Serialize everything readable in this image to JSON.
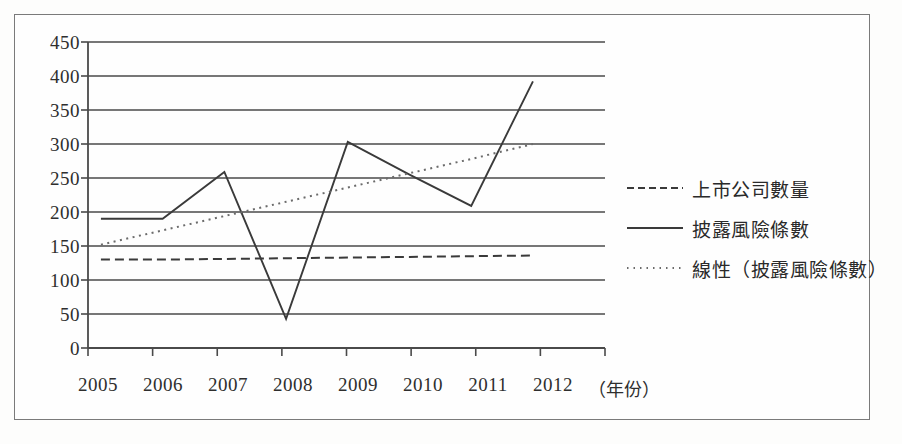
{
  "chart_data": {
    "type": "line",
    "title": "",
    "xlabel": "（年份）",
    "ylabel": "",
    "categories": [
      "2005",
      "2006",
      "2007",
      "2008",
      "2009",
      "2010",
      "2011",
      "2012"
    ],
    "x_tick_labels": [
      "2005",
      "2006",
      "2007",
      "2008",
      "2009",
      "2010",
      "2011",
      "2012"
    ],
    "y_tick_labels": [
      "0",
      "50",
      "100",
      "150",
      "200",
      "250",
      "300",
      "350",
      "400",
      "450"
    ],
    "y_ticks": [
      0,
      50,
      100,
      150,
      200,
      250,
      300,
      350,
      400,
      450
    ],
    "ylim": [
      0,
      450
    ],
    "grid": "horizontal",
    "legend_position": "right",
    "series": [
      {
        "name": "上市公司數量",
        "style": "dashed",
        "color": "#3a3a3a",
        "values": [
          130,
          130,
          131,
          132,
          133,
          134,
          135,
          136
        ]
      },
      {
        "name": "披露風險條數",
        "style": "solid",
        "color": "#3a3a3a",
        "values": [
          190,
          190,
          259,
          43,
          303,
          255,
          209,
          392
        ]
      },
      {
        "name": "線性（披露風險條數）",
        "style": "dotted",
        "color": "#6b6b6b",
        "values": [
          152,
          173,
          194,
          215,
          236,
          257,
          278,
          300
        ]
      }
    ]
  },
  "legend": {
    "items": [
      {
        "label": "上市公司數量",
        "style": "dashed"
      },
      {
        "label": "披露風險條數",
        "style": "solid"
      },
      {
        "label": "線性（披露風險條數）",
        "style": "dotted"
      }
    ]
  },
  "axes": {
    "x_title": "（年份）",
    "y_tick_0": "0",
    "y_tick_1": "50",
    "y_tick_2": "100",
    "y_tick_3": "150",
    "y_tick_4": "200",
    "y_tick_5": "250",
    "y_tick_6": "300",
    "y_tick_7": "350",
    "y_tick_8": "400",
    "y_tick_9": "450"
  },
  "colors": {
    "line": "#3a3a3a",
    "trend": "#6b6b6b",
    "grid": "#4a4a4a",
    "frame": "#7a7a7a",
    "background": "#fefefe"
  }
}
